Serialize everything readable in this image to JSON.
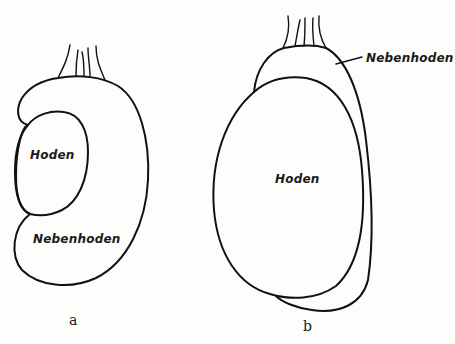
{
  "figure_a": {
    "caption": "a",
    "labels": {
      "testis": "Hoden",
      "epididymis": "Nebenhoden"
    }
  },
  "figure_b": {
    "caption": "b",
    "labels": {
      "testis": "Hoden",
      "epididymis": "Nebenhoden"
    }
  },
  "colors": {
    "stroke": "#111111",
    "background": "#fdfdfc"
  }
}
